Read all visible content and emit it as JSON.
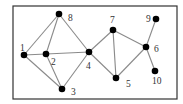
{
  "diagram": {
    "type": "undirected-graph",
    "nodes": [
      {
        "id": "1",
        "label": "1"
      },
      {
        "id": "2",
        "label": "2"
      },
      {
        "id": "3",
        "label": "3"
      },
      {
        "id": "4",
        "label": "4"
      },
      {
        "id": "5",
        "label": "5"
      },
      {
        "id": "6",
        "label": "6"
      },
      {
        "id": "7",
        "label": "7"
      },
      {
        "id": "8",
        "label": "8"
      },
      {
        "id": "9",
        "label": "9"
      },
      {
        "id": "10",
        "label": "10"
      }
    ],
    "edges": [
      [
        "1",
        "8"
      ],
      [
        "1",
        "2"
      ],
      [
        "1",
        "3"
      ],
      [
        "2",
        "8"
      ],
      [
        "2",
        "3"
      ],
      [
        "2",
        "4"
      ],
      [
        "8",
        "4"
      ],
      [
        "3",
        "4"
      ],
      [
        "4",
        "7"
      ],
      [
        "4",
        "5"
      ],
      [
        "7",
        "5"
      ],
      [
        "7",
        "6"
      ],
      [
        "5",
        "6"
      ],
      [
        "6",
        "9"
      ],
      [
        "6",
        "10"
      ]
    ]
  }
}
